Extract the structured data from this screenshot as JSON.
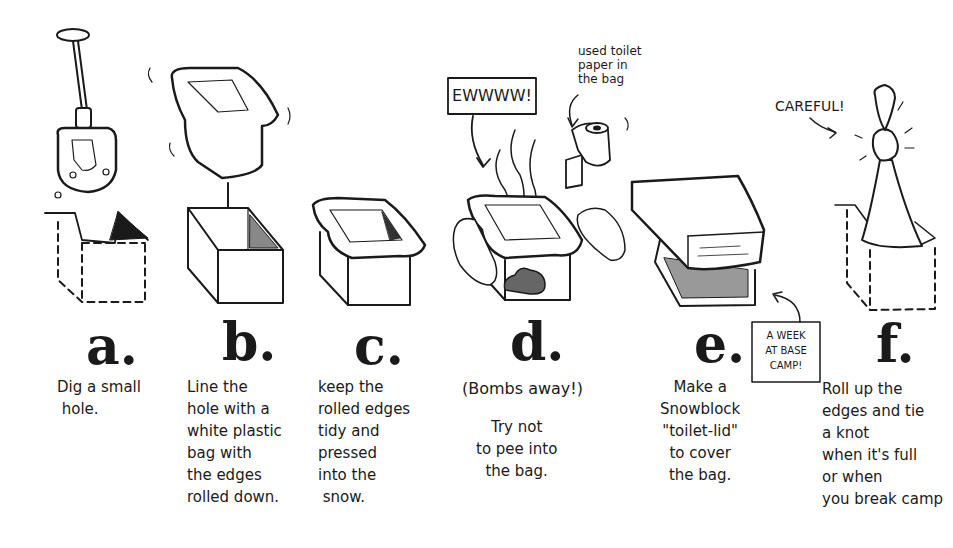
{
  "steps": [
    {
      "letter": "a.",
      "caption": "Dig a small\n hole.",
      "illustration": "shovel-and-hole"
    },
    {
      "letter": "b.",
      "caption": "Line the\nhole with a\nwhite plastic\nbag with\nthe edges\nrolled down.",
      "illustration": "bag-into-box"
    },
    {
      "letter": "c.",
      "caption": "keep the\nrolled edges\ntidy and\npressed\ninto the\n snow.",
      "illustration": "lined-box"
    },
    {
      "letter": "d.",
      "aside": "(Bombs away!)",
      "caption": "Try not\nto pee into\nthe bag.",
      "illustration": "box-with-poop"
    },
    {
      "letter": "e.",
      "caption": "Make a\nSnowblock\n\"toilet-lid\"\nto cover\nthe bag.",
      "illustration": "snowblock-lid"
    },
    {
      "letter": "f.",
      "caption": "Roll up the\nedges and tie\na knot\nwhen it's full\nor when\nyou break camp",
      "illustration": "knotted-bag"
    }
  ],
  "callouts": {
    "ewww": "EWWWW!",
    "toilet_paper": "used toilet\npaper in\nthe bag",
    "week_at_base": "A WEEK\nAT BASE\nCAMP!",
    "careful": "CAREFUL!"
  },
  "colors": {
    "ink": "#1a1a1a",
    "paper": "#ffffff",
    "shade": "#555555"
  }
}
